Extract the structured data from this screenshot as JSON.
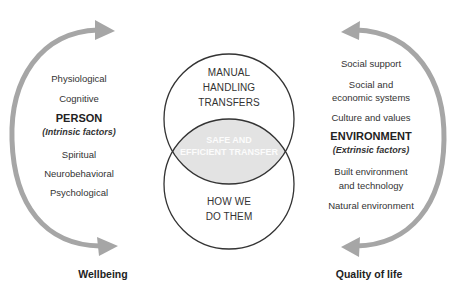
{
  "person": {
    "items_top": [
      "Physiological",
      "Cognitive"
    ],
    "title": "PERSON",
    "subtitle": "(Intrinsic factors)",
    "items_bottom": [
      "Spiritual",
      "Neurobehavioral",
      "Psychological"
    ],
    "footer": "Wellbeing"
  },
  "environment": {
    "items_top": [
      "Social support",
      "Social and",
      "economic systems",
      "Culture and values"
    ],
    "title": "ENVIRONMENT",
    "subtitle": "(Extrinsic factors)",
    "items_bottom": [
      "Built environment",
      "and technology",
      "Natural environment"
    ],
    "footer": "Quality of life"
  },
  "venn": {
    "top_circle_lines": [
      "MANUAL",
      "HANDLING",
      "TRANSFERS"
    ],
    "bottom_circle_lines": [
      "HOW WE",
      "DO THEM"
    ],
    "overlap_lines": [
      "SAFE AND",
      "EFFICIENT TRANSFER"
    ]
  },
  "colors": {
    "arrow": "#a6a6a6",
    "overlap_fill": "#e3e3e3",
    "circle_stroke": "#333333",
    "text": "#333333"
  }
}
